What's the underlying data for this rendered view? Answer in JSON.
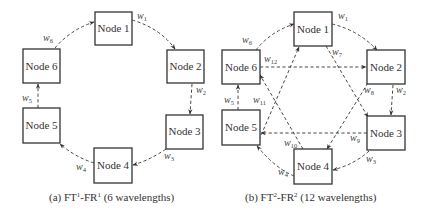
{
  "diagrams": [
    {
      "id": "a",
      "caption": {
        "prefix": "(a) FT",
        "sup1": "1",
        "mid": "-FR",
        "sup2": "1",
        "suffix": " (6 wavelengths)"
      },
      "nodes": [
        {
          "label": "Node 1"
        },
        {
          "label": "Node 2"
        },
        {
          "label": "Node 3"
        },
        {
          "label": "Node 4"
        },
        {
          "label": "Node 5"
        },
        {
          "label": "Node 6"
        }
      ],
      "edges": [
        {
          "from": "Node 1",
          "to": "Node 2",
          "w": "w",
          "sub": "1"
        },
        {
          "from": "Node 2",
          "to": "Node 3",
          "w": "w",
          "sub": "2"
        },
        {
          "from": "Node 3",
          "to": "Node 4",
          "w": "w",
          "sub": "3"
        },
        {
          "from": "Node 4",
          "to": "Node 5",
          "w": "w",
          "sub": "4"
        },
        {
          "from": "Node 5",
          "to": "Node 6",
          "w": "w",
          "sub": "5"
        },
        {
          "from": "Node 6",
          "to": "Node 1",
          "w": "w",
          "sub": "6"
        }
      ]
    },
    {
      "id": "b",
      "caption": {
        "prefix": "(b) FT",
        "sup1": "2",
        "mid": "-FR",
        "sup2": "2",
        "suffix": " (12 wavelengths)"
      },
      "nodes": [
        {
          "label": "Node 1"
        },
        {
          "label": "Node 2"
        },
        {
          "label": "Node 3"
        },
        {
          "label": "Node 4"
        },
        {
          "label": "Node 5"
        },
        {
          "label": "Node 6"
        }
      ],
      "edges": [
        {
          "from": "Node 1",
          "to": "Node 2",
          "w": "w",
          "sub": "1"
        },
        {
          "from": "Node 2",
          "to": "Node 3",
          "w": "w",
          "sub": "2"
        },
        {
          "from": "Node 3",
          "to": "Node 4",
          "w": "w",
          "sub": "3"
        },
        {
          "from": "Node 4",
          "to": "Node 5",
          "w": "w",
          "sub": "4"
        },
        {
          "from": "Node 5",
          "to": "Node 6",
          "w": "w",
          "sub": "5"
        },
        {
          "from": "Node 6",
          "to": "Node 1",
          "w": "w",
          "sub": "6"
        },
        {
          "from": "Node 1",
          "to": "Node 3",
          "w": "w",
          "sub": "7"
        },
        {
          "from": "Node 2",
          "to": "Node 4",
          "w": "w",
          "sub": "8"
        },
        {
          "from": "Node 3",
          "to": "Node 5",
          "w": "w",
          "sub": "9"
        },
        {
          "from": "Node 4",
          "to": "Node 6",
          "w": "w",
          "sub": "10"
        },
        {
          "from": "Node 5",
          "to": "Node 1",
          "w": "w",
          "sub": "11"
        },
        {
          "from": "Node 6",
          "to": "Node 2",
          "w": "w",
          "sub": "12"
        }
      ]
    }
  ]
}
